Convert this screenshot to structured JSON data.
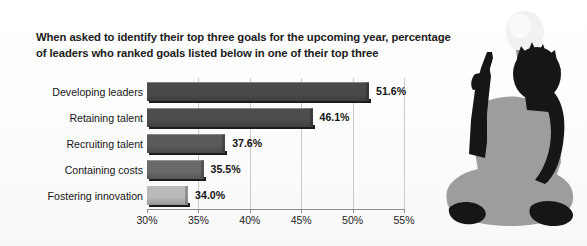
{
  "title": "When asked to identify their top three goals for the upcoming year, percentage of leaders who ranked goals listed below in one of their top three",
  "illustration": {
    "lightbulb_name": "lightbulb-icon",
    "person_name": "seated-person-silhouette"
  },
  "colors": {
    "bar_dark": "#4a4a4a",
    "bar_darker": "#3d3d3d",
    "bar_light": "#b9b9b9",
    "gridline": "#c9c9c9",
    "text": "#161616",
    "card_border": "#e2e2e2",
    "silhouette_black": "#161616",
    "silhouette_gray": "#9a9a9a",
    "bulb": "#f2f2f2",
    "bulb_base": "#8c8c8c"
  },
  "chart_data": {
    "type": "bar",
    "orientation": "horizontal",
    "title": "When asked to identify their top three goals for the upcoming year, percentage of leaders who ranked goals listed below in one of their top three",
    "xlabel": "",
    "ylabel": "",
    "categories": [
      "Developing leaders",
      "Retaining talent",
      "Recruiting talent",
      "Containing costs",
      "Fostering innovation"
    ],
    "values": [
      51.6,
      46.1,
      37.6,
      35.5,
      34.0
    ],
    "value_labels": [
      "51.6%",
      "46.1%",
      "37.6%",
      "35.5%",
      "34.0%"
    ],
    "bar_colors": [
      "#4a4a4a",
      "#4d4d4d",
      "#5a5a5a",
      "#6a6a6a",
      "#b9b9b9"
    ],
    "xlim": [
      30,
      55
    ],
    "xticks": [
      30,
      35,
      40,
      45,
      50,
      55
    ],
    "xtick_labels": [
      "30%",
      "35%",
      "40%",
      "45%",
      "50%",
      "55%"
    ],
    "grid": true,
    "legend": "none"
  }
}
